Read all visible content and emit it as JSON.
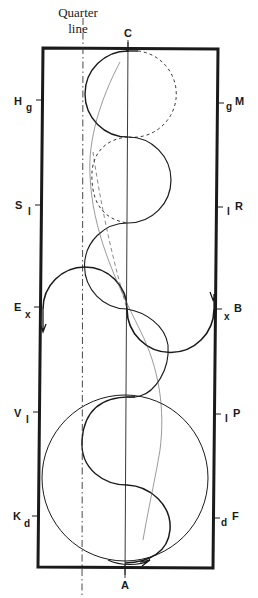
{
  "title_annotation": {
    "line1": "Quarter",
    "line2": "line"
  },
  "markers": {
    "top": "C",
    "bottom": "A",
    "left": [
      {
        "letter": "H",
        "sub": "g"
      },
      {
        "letter": "S",
        "sub": "I"
      },
      {
        "letter": "E",
        "sub": "x"
      },
      {
        "letter": "V",
        "sub": "I"
      },
      {
        "letter": "K",
        "sub": "d"
      }
    ],
    "right": [
      {
        "letter": "M",
        "sub": "g"
      },
      {
        "letter": "R",
        "sub": "I"
      },
      {
        "letter": "B",
        "sub": "x"
      },
      {
        "letter": "P",
        "sub": "I"
      },
      {
        "letter": "F",
        "sub": "d"
      }
    ]
  },
  "colors": {
    "ink": "#1a1a1a",
    "background": "#ffffff"
  }
}
